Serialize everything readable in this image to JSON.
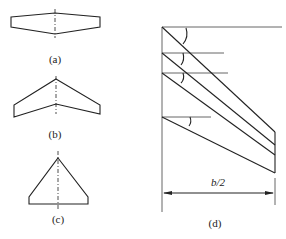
{
  "figure": {
    "panels": [
      {
        "id": "a",
        "label": "(a)",
        "description": "tapered straight wing planform"
      },
      {
        "id": "b",
        "label": "(b)",
        "description": "swept-back wing planform"
      },
      {
        "id": "c",
        "label": "(c)",
        "description": "delta wing planform"
      },
      {
        "id": "d",
        "label": "(d)",
        "description": "sweep angles of half-wing lines",
        "dimension_label": "b/2"
      }
    ]
  }
}
